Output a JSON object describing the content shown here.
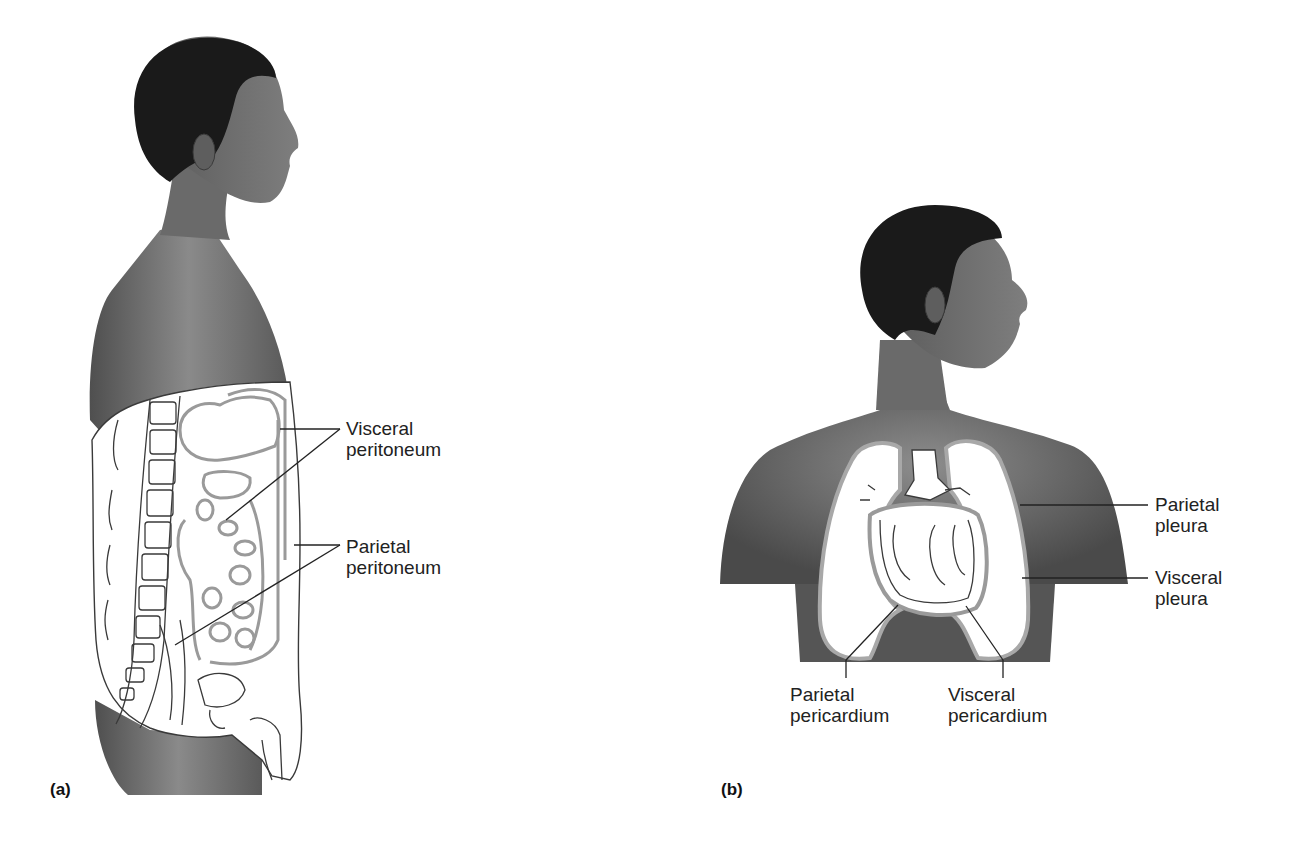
{
  "figure": {
    "panels": [
      {
        "id": "a",
        "marker": "(a)",
        "subject": "lateral view, abdominopelvic cavity",
        "labels": [
          {
            "line1": "Visceral",
            "line2": "peritoneum"
          },
          {
            "line1": "Parietal",
            "line2": "peritoneum"
          }
        ]
      },
      {
        "id": "b",
        "marker": "(b)",
        "subject": "anterior view, thoracic cavity",
        "labels": [
          {
            "line1": "Parietal",
            "line2": "pleura"
          },
          {
            "line1": "Visceral",
            "line2": "pleura"
          },
          {
            "line1": "Parietal",
            "line2": "pericardium"
          },
          {
            "line1": "Visceral",
            "line2": "pericardium"
          }
        ]
      }
    ]
  },
  "colors": {
    "skin": "#6e6e6e",
    "skin_light": "#8f8f8f",
    "hair": "#1c1c1c",
    "membrane": "#9a9a9a",
    "outline": "#3a3a3a",
    "leader": "#222222",
    "cavity": "#ffffff"
  }
}
